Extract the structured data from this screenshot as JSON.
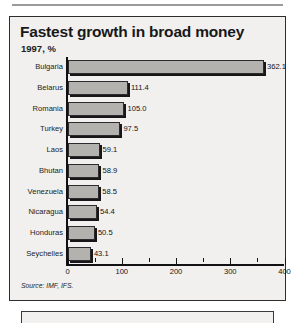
{
  "figure": {
    "title": "Fastest growth in broad money",
    "subtitle": "1997, %",
    "source": "Source: IMF, IFS."
  },
  "chart_data": {
    "type": "bar",
    "orientation": "horizontal",
    "title": "Fastest growth in broad money",
    "subtitle": "1997, %",
    "xlabel": "",
    "ylabel": "",
    "xlim": [
      0,
      400
    ],
    "xticks": [
      0,
      100,
      200,
      300,
      400
    ],
    "xticklabels": [
      "0",
      "100",
      "200",
      "300",
      "400"
    ],
    "minor_tick_interval": 50,
    "grid": false,
    "legend": null,
    "source": "Source: IMF, IFS.",
    "bar_color": "#b3b2ae",
    "bar_edge_color": "#2b2b2d",
    "categories": [
      "Bulgaria",
      "Belarus",
      "Romania",
      "Turkey",
      "Laos",
      "Bhutan",
      "Venezuela",
      "Nicaragua",
      "Honduras",
      "Seychelles"
    ],
    "values": [
      362.1,
      111.4,
      105.0,
      97.5,
      59.1,
      58.9,
      58.5,
      54.4,
      50.5,
      43.1
    ],
    "value_labels": [
      "362.1",
      "111.4",
      "105.0",
      "97.5",
      "59.1",
      "58.9",
      "58.5",
      "54.4",
      "50.5",
      "43.1"
    ]
  }
}
